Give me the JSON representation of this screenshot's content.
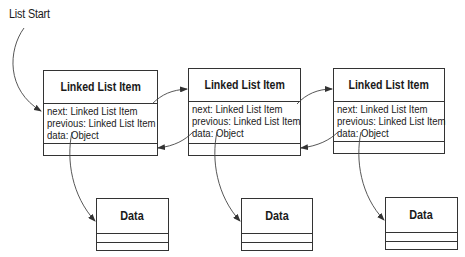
{
  "diagram": {
    "start_label": "List Start",
    "items": [
      {
        "title": "Linked List Item",
        "fields": [
          "next: Linked List Item",
          "previous: Linked List Item",
          "data: Object"
        ]
      },
      {
        "title": "Linked List Item",
        "fields": [
          "next: Linked List Item",
          "previous: Linked List Item",
          "data: Object"
        ]
      },
      {
        "title": "Linked List Item",
        "fields": [
          "next: Linked List Item",
          "previous: Linked List Item",
          "data: Object"
        ]
      }
    ],
    "data_boxes": [
      {
        "title": "Data"
      },
      {
        "title": "Data"
      },
      {
        "title": "Data"
      }
    ],
    "colors": {
      "line": "#333333",
      "background": "#ffffff",
      "text": "#1a1a1a"
    }
  }
}
